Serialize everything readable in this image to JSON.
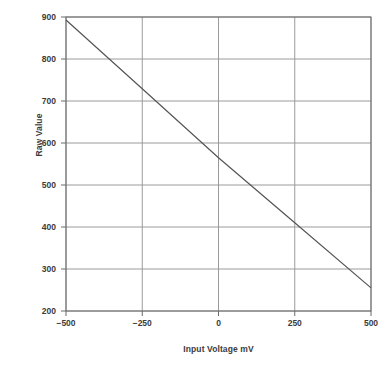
{
  "chart_data": {
    "type": "line",
    "title": "",
    "xlabel": "Input Voltage mV",
    "ylabel": "Raw Value",
    "xlim": [
      -500,
      500
    ],
    "ylim": [
      200,
      900
    ],
    "xticks": [
      "−500",
      "−250",
      "0",
      "250",
      "500"
    ],
    "xtick_values": [
      -500,
      -250,
      0,
      250,
      500
    ],
    "yticks": [
      "900",
      "800",
      "700",
      "600",
      "500",
      "400",
      "300",
      "200"
    ],
    "ytick_values": [
      900,
      800,
      700,
      600,
      500,
      400,
      300,
      200
    ],
    "grid": true,
    "legend": "none",
    "series": [
      {
        "name": "Raw Value vs Input Voltage",
        "x": [
          -500,
          -250,
          0,
          250,
          500
        ],
        "values": [
          893,
          729,
          565,
          410,
          255
        ]
      }
    ],
    "colors": {
      "line": "#555555",
      "grid": "#9a9a9a",
      "axis": "#6b6b6b",
      "text": "#3b3b3b",
      "background": "#ffffff"
    }
  }
}
